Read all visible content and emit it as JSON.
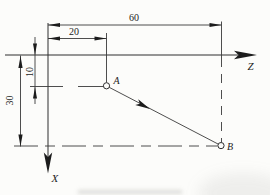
{
  "diagram": {
    "type": "engineering-drawing",
    "axes": {
      "horizontal_label": "Z",
      "vertical_label": "X"
    },
    "points": [
      {
        "label": "A",
        "z": 20,
        "x": 10
      },
      {
        "label": "B",
        "z": 60,
        "x": 30
      }
    ],
    "dimensions": [
      {
        "label": "60",
        "orientation": "horizontal"
      },
      {
        "label": "20",
        "orientation": "horizontal"
      },
      {
        "label": "10",
        "orientation": "vertical"
      },
      {
        "label": "30",
        "orientation": "vertical"
      }
    ],
    "vector": {
      "from": "A",
      "to": "B"
    },
    "colors": {
      "line": "#2e2e2e",
      "text": "#1c1c1c",
      "background": "#fcfcfa"
    }
  }
}
